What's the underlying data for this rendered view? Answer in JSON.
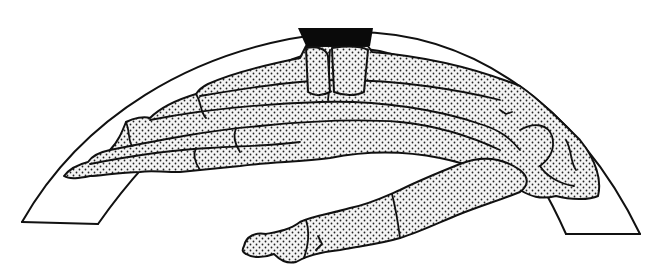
{
  "figure": {
    "colors": {
      "background": "#ffffff",
      "ink": "#111111",
      "stipple_bg": "#f4f4f4",
      "block": "#0a0a0a"
    },
    "elements": [
      "arch-band-outline",
      "black-block",
      "hand-bones-upper-digits",
      "hand-bones-lower-digit",
      "carpal-bones-right"
    ]
  }
}
